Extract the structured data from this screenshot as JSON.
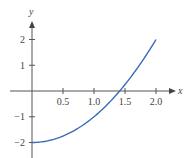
{
  "chart_data": {
    "type": "line",
    "title": "",
    "xlabel": "x",
    "ylabel": "y",
    "function": "y = x^2 - 2",
    "xlim": [
      0,
      2.0
    ],
    "ylim": [
      -2,
      2
    ],
    "x_ticks": [
      "0.5",
      "1.0",
      "1.5",
      "2.0"
    ],
    "y_ticks": [
      "2",
      "1",
      "−1",
      "−2"
    ],
    "grid": false,
    "legend": null,
    "series": [
      {
        "name": "y = x^2 - 2",
        "color": "#3a6bb5",
        "x": [
          0,
          0.25,
          0.5,
          0.75,
          1.0,
          1.25,
          1.414,
          1.5,
          1.75,
          2.0
        ],
        "values": [
          -2,
          -1.9375,
          -1.75,
          -1.4375,
          -1.0,
          -0.4375,
          0,
          0.25,
          1.0625,
          2.0
        ]
      }
    ]
  },
  "colors": {
    "curve": "#3a6bb5",
    "axis": "#555555",
    "text": "#444444"
  },
  "axes": {
    "x_label": "x",
    "y_label": "y"
  }
}
